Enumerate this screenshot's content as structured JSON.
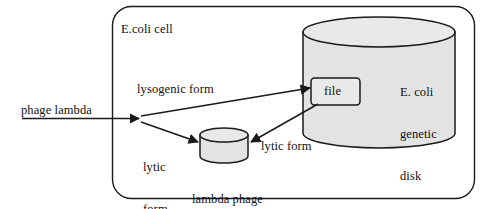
{
  "diagram": {
    "background_color": "#ffffff",
    "stroke_color": "#1a1a1a",
    "cylinder_fill": "#e3e3e3",
    "cell": {
      "label": "E.coli cell",
      "shape": "rounded-rectangle"
    },
    "host_disk": {
      "label_line1": "E. coli",
      "label_line2": "genetic",
      "label_line3": "disk",
      "shape": "cylinder"
    },
    "file": {
      "label": "file",
      "shape": "rounded-rectangle"
    },
    "phage_disk": {
      "label_line1": "lambda phage",
      "label_line2": "genetic disk",
      "shape": "cylinder"
    },
    "arrows": {
      "entry_label": "phage lambda",
      "lysogenic_label": "lysogenic form",
      "lytic_left_line1": "lytic",
      "lytic_left_line2": "form",
      "lytic_right_label": "lytic form"
    }
  }
}
